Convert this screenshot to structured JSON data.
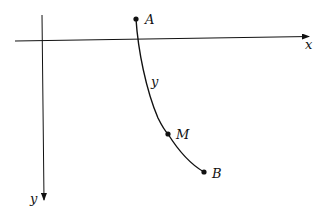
{
  "diagram": {
    "type": "coordinate-curve",
    "axes": {
      "x_label": "x",
      "y_label": "y",
      "y_axis_direction": "down"
    },
    "points": [
      {
        "name": "A",
        "label": "A"
      },
      {
        "name": "M",
        "label": "M"
      },
      {
        "name": "B",
        "label": "B"
      }
    ],
    "curve_label": "y",
    "colors": {
      "stroke": "#111111",
      "background": "#ffffff"
    }
  }
}
